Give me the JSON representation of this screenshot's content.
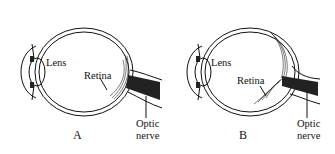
{
  "diagram": {
    "panels": [
      {
        "id": "A",
        "caption": "A",
        "labels": {
          "lens": "Lens",
          "retina": "Retina",
          "optic_nerve_line1": "Optic",
          "optic_nerve_line2": "nerve"
        }
      },
      {
        "id": "B",
        "caption": "B",
        "labels": {
          "lens": "Lens",
          "retina": "Retina",
          "optic_nerve_line1": "Optic",
          "optic_nerve_line2": "nerve"
        }
      }
    ]
  }
}
